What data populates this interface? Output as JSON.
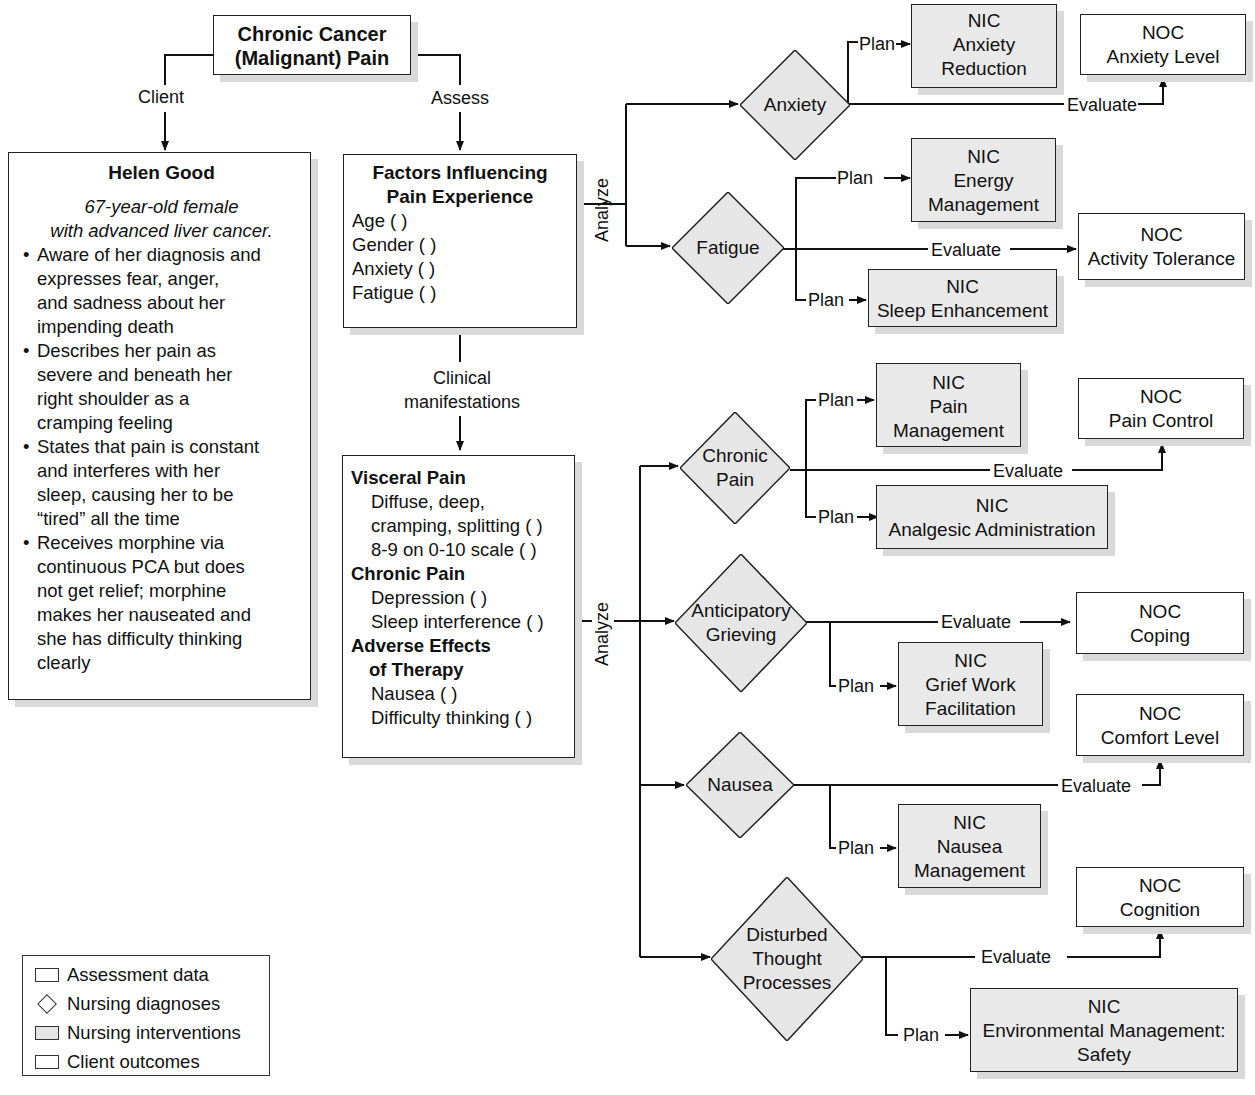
{
  "title": {
    "line1": "Chronic Cancer",
    "line2": "(Malignant) Pain"
  },
  "edge_labels": {
    "client": "Client",
    "assess": "Assess",
    "clinical_line1": "Clinical",
    "clinical_line2": "manifestations",
    "analyze_top": "Analyze",
    "analyze_bottom": "Analyze",
    "plan": "Plan",
    "evaluate": "Evaluate"
  },
  "client": {
    "name": "Helen Good",
    "sub_line1": "67-year-old female",
    "sub_line2": "with advanced liver cancer.",
    "bullets": [
      [
        "Aware of her diagnosis and",
        "expresses fear, anger,",
        "and sadness about her",
        "impending death"
      ],
      [
        "Describes her pain as",
        "severe and beneath her",
        "right shoulder as a",
        "cramping feeling"
      ],
      [
        "States that pain is constant",
        "and interferes with her",
        "sleep, causing her to be",
        "“tired” all the time"
      ],
      [
        "Receives morphine via",
        "continuous PCA but does",
        "not get relief; morphine",
        "makes her nauseated and",
        "she has difficulty thinking",
        "clearly"
      ]
    ]
  },
  "factors": {
    "heading_line1": "Factors Influencing",
    "heading_line2": "Pain Experience",
    "items": [
      "Age ( )",
      "Gender ( )",
      "Anxiety ( )",
      "Fatigue ( )"
    ]
  },
  "manifestations": {
    "visceral_heading": "Visceral Pain",
    "visceral_items": [
      "Diffuse, deep,",
      "cramping, splitting ( )",
      "8-9 on 0-10 scale ( )"
    ],
    "chronic_heading": "Chronic Pain",
    "chronic_items": [
      "Depression ( )",
      "Sleep interference ( )"
    ],
    "adverse_heading_line1": "Adverse Effects",
    "adverse_heading_line2": "of Therapy",
    "adverse_items": [
      "Nausea ( )",
      "Difficulty thinking ( )"
    ]
  },
  "diagnoses": {
    "anxiety": [
      "Anxiety"
    ],
    "fatigue": [
      "Fatigue"
    ],
    "chronic_pain": [
      "Chronic",
      "Pain"
    ],
    "grieving": [
      "Anticipatory",
      "Grieving"
    ],
    "nausea": [
      "Nausea"
    ],
    "thought": [
      "Disturbed",
      "Thought",
      "Processes"
    ]
  },
  "interventions": {
    "anxiety_reduction": [
      "NIC",
      "Anxiety",
      "Reduction"
    ],
    "energy_management": [
      "NIC",
      "Energy",
      "Management"
    ],
    "sleep_enhancement": [
      "NIC",
      "Sleep Enhancement"
    ],
    "pain_management": [
      "NIC",
      "Pain",
      "Management"
    ],
    "analgesic_admin": [
      "NIC",
      "Analgesic Administration"
    ],
    "grief_work": [
      "NIC",
      "Grief Work",
      "Facilitation"
    ],
    "nausea_management": [
      "NIC",
      "Nausea",
      "Management"
    ],
    "env_management": [
      "NIC",
      "Environmental Management:",
      "Safety"
    ]
  },
  "outcomes": {
    "anxiety_level": [
      "NOC",
      "Anxiety Level"
    ],
    "activity_tolerance": [
      "NOC",
      "Activity Tolerance"
    ],
    "pain_control": [
      "NOC",
      "Pain Control"
    ],
    "coping": [
      "NOC",
      "Coping"
    ],
    "comfort_level": [
      "NOC",
      "Comfort Level"
    ],
    "cognition": [
      "NOC",
      "Cognition"
    ]
  },
  "legend": {
    "items": [
      "Assessment data",
      "Nursing diagnoses",
      "Nursing interventions",
      "Client outcomes"
    ]
  },
  "colors": {
    "line": "#111111",
    "diagnosis_fill": "#e6e6e6",
    "intervention_fill": "#e9e9e9",
    "outcome_fill": "#ffffff",
    "shadow": "#d9d9d9"
  }
}
